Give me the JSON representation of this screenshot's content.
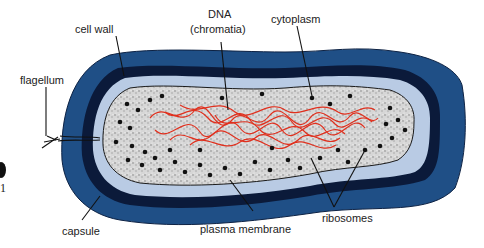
{
  "diagram": {
    "labels": {
      "cell_wall": "cell wall",
      "dna_line1": "DNA",
      "dna_line2": "(chromatia)",
      "cytoplasm": "cytoplasm",
      "flagellum": "flagellum",
      "capsule": "capsule",
      "plasma_membrane": "plasma membrane",
      "ribosomes": "ribosomes"
    },
    "edge_artifact": {
      "glyph": "1"
    },
    "colors": {
      "capsule": "#1f4f86",
      "cell_wall": "#0b1a3a",
      "periplasm": "#b9cbe4",
      "cytoplasm": "#cfcfcf",
      "dna": "#e0301e",
      "ribosome": "#111111",
      "leader_line": "#111111"
    }
  }
}
